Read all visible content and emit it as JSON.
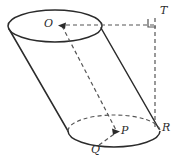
{
  "figure": {
    "kind": "geometry-diagram",
    "background_color": "#ffffff",
    "stroke_color": "#2b2b2b",
    "dash_color": "#555555",
    "width": 174,
    "height": 163,
    "labels": [
      {
        "id": "O",
        "text": "O",
        "role": "top-base-center",
        "x": 44,
        "y": 18
      },
      {
        "id": "T",
        "text": "T",
        "role": "apex-corner-point",
        "x": 160,
        "y": 5
      },
      {
        "id": "P",
        "text": "P",
        "role": "bottom-base-center",
        "x": 121,
        "y": 125
      },
      {
        "id": "Q",
        "text": "Q",
        "role": "bottom-base-front-point",
        "x": 91,
        "y": 144
      },
      {
        "id": "R",
        "text": "R",
        "role": "bottom-base-right-point",
        "x": 162,
        "y": 122
      }
    ],
    "markers": [
      {
        "id": "right-angle-T",
        "text": "",
        "role": "right-angle-square",
        "x": 152,
        "y": 18
      }
    ],
    "solid_elements": [
      "top-ellipse-outline",
      "left-slant-edge",
      "right-slant-edge",
      "bottom-ellipse-front-arc"
    ],
    "dashed_elements": [
      "bottom-ellipse-back-arc",
      "axis-O-to-P",
      "horizontal-O-to-T",
      "vertical-T-to-R",
      "segment-Q-to-P"
    ],
    "arrowheads": [
      {
        "id": "arrow-to-O",
        "points_to": "O",
        "direction": "left"
      },
      {
        "id": "arrow-to-P",
        "points_to": "P",
        "direction": "right"
      }
    ]
  }
}
